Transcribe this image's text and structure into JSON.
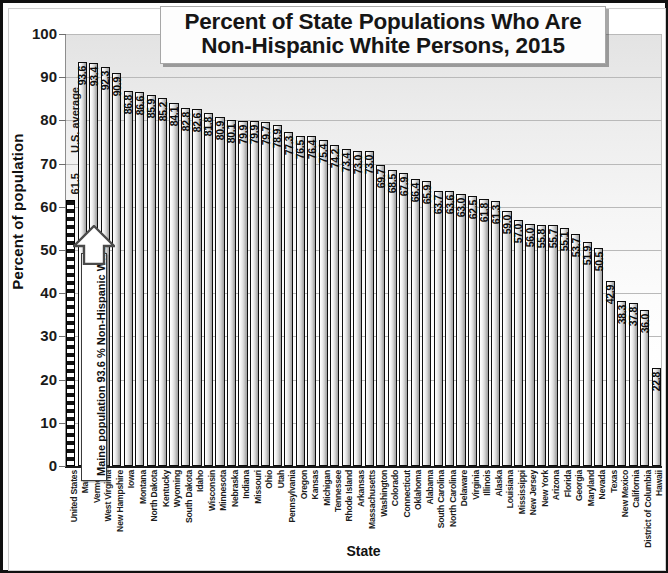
{
  "chart_data": {
    "type": "bar",
    "title": "Percent of State Populations Who Are Non-Hispanic White Persons, 2015",
    "title_line1": "Percent of State Populations Who Are",
    "title_line2": "Non-Hispanic White Persons, 2015",
    "xlabel": "State",
    "ylabel": "Percent of population",
    "ylim": [
      0,
      100
    ],
    "ytick_labels": [
      "100",
      "90",
      "80",
      "70",
      "60",
      "50",
      "40",
      "30",
      "20",
      "10",
      "0"
    ],
    "ytick_values": [
      100,
      90,
      80,
      70,
      60,
      50,
      40,
      30,
      20,
      10,
      0
    ],
    "grid": true,
    "legend": false,
    "categories": [
      "United States",
      "Maine",
      "Vermont",
      "West Virginia",
      "New Hampshire",
      "Iowa",
      "Montana",
      "North Dakota",
      "Kentucky",
      "Wyoming",
      "South Dakota",
      "Idaho",
      "Wisconsin",
      "Minnesota",
      "Nebraska",
      "Indiana",
      "Missouri",
      "Ohio",
      "Utah",
      "Pennsylvania",
      "Oregon",
      "Kansas",
      "Michigan",
      "Tennessee",
      "Rhode Island",
      "Arkansas",
      "Massachusetts",
      "Washington",
      "Colorado",
      "Connecticut",
      "Oklahoma",
      "Alabama",
      "South Carolina",
      "North Carolina",
      "Delaware",
      "Virginia",
      "Illinois",
      "Alaska",
      "Louisiana",
      "Mississippi",
      "New Jersey",
      "New York",
      "Arizona",
      "Florida",
      "Georgia",
      "Maryland",
      "Nevada",
      "Texas",
      "New Mexico",
      "California",
      "District of Columbia",
      "Hawaii"
    ],
    "values": [
      61.5,
      93.6,
      93.4,
      92.3,
      90.9,
      86.8,
      86.6,
      85.9,
      85.2,
      84.1,
      82.8,
      82.6,
      81.8,
      80.9,
      80.1,
      79.9,
      79.9,
      79.7,
      78.9,
      77.3,
      76.5,
      76.4,
      75.4,
      74.2,
      73.4,
      73.0,
      73.0,
      69.7,
      68.5,
      67.9,
      66.4,
      65.9,
      63.7,
      63.6,
      63.0,
      62.5,
      61.8,
      61.3,
      59.0,
      57.0,
      56.0,
      55.8,
      55.7,
      55.1,
      53.7,
      51.9,
      50.5,
      42.9,
      38.3,
      37.8,
      36.0,
      22.8
    ],
    "value_labels": [
      "61.5",
      "93.6",
      "93.4",
      "92.3",
      "90.9",
      "86.8",
      "86.6",
      "85.9",
      "85.2",
      "84.1",
      "82.8",
      "82.6",
      "81.8",
      "80.9",
      "80.1",
      "79.9",
      "79.9",
      "79.7",
      "78.9",
      "77.3",
      "76.5",
      "76.4",
      "75.4",
      "74.2",
      "73.4",
      "73.0",
      "73.0",
      "69.7",
      "68.5",
      "67.9",
      "66.4",
      "65.9",
      "63.7",
      "63.6",
      "63.0",
      "62.5",
      "61.8",
      "61.3",
      "59.0",
      "57.0",
      "56.0",
      "55.8",
      "55.7",
      "55.1",
      "53.7",
      "51.9",
      "50.5",
      "42.9",
      "38.3",
      "37.8",
      "36.0",
      "22.8"
    ],
    "annotations": {
      "us_average": "U.S. average",
      "us_average_value": "61.5",
      "callout": "Maine population 93.6 % Non-Hispanic White"
    },
    "colors": {
      "bar_fill_light": "#ffffff",
      "bar_fill_dark": "#a0a0a0",
      "bar_border": "#0d0d0d",
      "gridline": "#b9b9b9",
      "text": "#111111",
      "plot_bg_top": "#e3e3e3",
      "plot_bg_bottom": "#ffffff"
    }
  }
}
